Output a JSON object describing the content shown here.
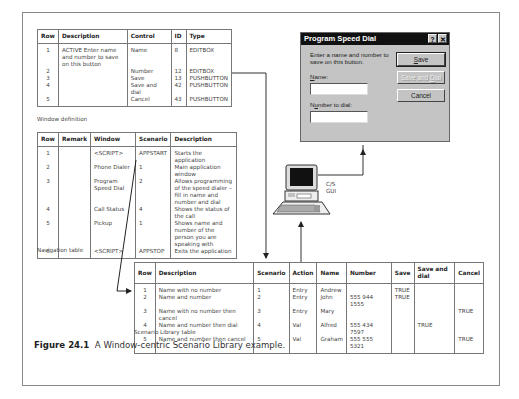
{
  "window_definition": {
    "caption": "Window definition",
    "columns": [
      "Row",
      "Description",
      "Control",
      "ID",
      "Type"
    ],
    "rows": [
      {
        "row": "1",
        "description": "ACTIVE Enter name and number to save on this button",
        "control": "Name",
        "id": "8",
        "type": "EDITBOX"
      },
      {
        "row": "2",
        "description": "",
        "control": "Number",
        "id": "12",
        "type": "EDITBOX"
      },
      {
        "row": "3",
        "description": "",
        "control": "Save",
        "id": "13",
        "type": "PUSHBUTTON"
      },
      {
        "row": "4",
        "description": "",
        "control": "Save and dial",
        "id": "42",
        "type": "PUSHBUTTON"
      },
      {
        "row": "5",
        "description": "",
        "control": "Cancel",
        "id": "43",
        "type": "PUSHBUTTON"
      }
    ]
  },
  "navigation_table": {
    "caption": "Navigation table",
    "columns": [
      "Row",
      "Remark",
      "Window",
      "Scenario",
      "Description"
    ],
    "rows": [
      {
        "row": "1",
        "remark": "",
        "window": "<SCRIPT>",
        "scenario": "APPSTART",
        "description": "Starts the application"
      },
      {
        "row": "2",
        "remark": "",
        "window": "Phone Dialer",
        "scenario": "1",
        "description": "Main application window"
      },
      {
        "row": "3",
        "remark": "",
        "window": "Program Speed Dial",
        "scenario": "2",
        "description": "Allows programming of the speed dialer – fill in name and number and dial"
      },
      {
        "row": "4",
        "remark": "",
        "window": "Call Status",
        "scenario": "4",
        "description": "Shows the status of the call"
      },
      {
        "row": "5",
        "remark": "",
        "window": "Pickup",
        "scenario": "1",
        "description": "Shows name and number of the person you are speaking with"
      },
      {
        "row": "6",
        "remark": "",
        "window": "<SCRIPT>",
        "scenario": "APPSTOP",
        "description": "Exits the application"
      }
    ]
  },
  "scenario_library": {
    "caption": "Scenario Library table",
    "columns": [
      "Row",
      "Description",
      "Scenario",
      "Action",
      "Name",
      "Number",
      "Save",
      "Save and dial",
      "Cancel"
    ],
    "rows": [
      {
        "row": "1",
        "description": "Name with no number",
        "scenario": "1",
        "action": "Entry",
        "name": "Andrew",
        "number": "",
        "save": "TRUE",
        "save_dial": "",
        "cancel": ""
      },
      {
        "row": "2",
        "description": "Name and number",
        "scenario": "2",
        "action": "Entry",
        "name": "John",
        "number": "555 944 1555",
        "save": "TRUE",
        "save_dial": "",
        "cancel": ""
      },
      {
        "row": "3",
        "description": "Name with no number then cancel",
        "scenario": "3",
        "action": "Entry",
        "name": "Mary",
        "number": "",
        "save": "",
        "save_dial": "",
        "cancel": "TRUE"
      },
      {
        "row": "4",
        "description": "Name and number then dial",
        "scenario": "4",
        "action": "Val",
        "name": "Alfred",
        "number": "555 434 7597",
        "save": "",
        "save_dial": "TRUE",
        "cancel": ""
      },
      {
        "row": "5",
        "description": "Name and number then cancel",
        "scenario": "5",
        "action": "Val",
        "name": "Graham",
        "number": "555 555 5321",
        "save": "",
        "save_dial": "",
        "cancel": "TRUE"
      }
    ]
  },
  "dialog": {
    "title": "Program Speed Dial",
    "help_icon": "?",
    "close_icon": "✕",
    "prompt": "Enter a name and number to save on this button.",
    "name_label_mnemonic": "N",
    "name_label_rest": "ame:",
    "number_label_pre": "N",
    "number_label_mnemonic": "u",
    "number_label_rest": "mber to dial:",
    "save_mnemonic": "S",
    "save_rest": "ave",
    "save_dial_pre": "Save and ",
    "save_dial_mnemonic": "D",
    "save_dial_rest": "ial",
    "cancel_label": "Cancel"
  },
  "computer": {
    "label_line1": "C/S",
    "label_line2": "GUI"
  },
  "figure": {
    "number": "Figure 24.1",
    "caption": "A Window-centric Scenario Library example."
  }
}
